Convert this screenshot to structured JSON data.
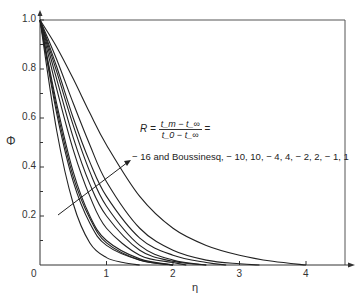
{
  "chart_data": {
    "type": "line",
    "title": "",
    "xlabel": "η",
    "ylabel": "Φ",
    "xlim": [
      0,
      4.6
    ],
    "ylim": [
      0,
      1.0
    ],
    "x_ticks": [
      "0",
      "1",
      "2",
      "3",
      "4"
    ],
    "y_ticks": [
      "0.2",
      "0.4",
      "0.6",
      "0.8",
      "1.0"
    ],
    "grid": false,
    "legend": null,
    "annotation": {
      "R_label": "R =",
      "numerator": "t_m − t_∞",
      "denominator": "t_0 − t_∞",
      "equals": "=",
      "values_text": "− 16 and Boussinesq, − 10, 10, − 4, 4, − 2, 2, − 1, 1",
      "arrow": "points in direction of increasing curve spread"
    },
    "series": [
      {
        "name": "-16",
        "x": [
          0,
          0.25,
          0.5,
          0.75,
          1.0,
          1.25,
          1.5
        ],
        "values": [
          1.0,
          0.55,
          0.25,
          0.09,
          0.03,
          0.01,
          0.0
        ]
      },
      {
        "name": "Boussinesq",
        "x": [
          0,
          0.25,
          0.5,
          0.75,
          1.0,
          1.5,
          2.0
        ],
        "values": [
          1.0,
          0.62,
          0.34,
          0.17,
          0.08,
          0.02,
          0.0
        ]
      },
      {
        "name": "-10",
        "x": [
          0,
          0.25,
          0.5,
          0.75,
          1.0,
          1.5,
          2.0
        ],
        "values": [
          1.0,
          0.64,
          0.36,
          0.19,
          0.09,
          0.02,
          0.0
        ]
      },
      {
        "name": "10",
        "x": [
          0,
          0.25,
          0.5,
          0.75,
          1.0,
          1.5,
          2.0
        ],
        "values": [
          1.0,
          0.66,
          0.38,
          0.2,
          0.1,
          0.025,
          0.0
        ]
      },
      {
        "name": "-4",
        "x": [
          0,
          0.25,
          0.5,
          0.75,
          1.0,
          1.5,
          2.0,
          2.2
        ],
        "values": [
          1.0,
          0.72,
          0.47,
          0.28,
          0.15,
          0.04,
          0.01,
          0.0
        ]
      },
      {
        "name": "4",
        "x": [
          0,
          0.25,
          0.5,
          0.75,
          1.0,
          1.5,
          2.0,
          2.5
        ],
        "values": [
          1.0,
          0.76,
          0.52,
          0.33,
          0.2,
          0.06,
          0.015,
          0.0
        ]
      },
      {
        "name": "-2",
        "x": [
          0,
          0.25,
          0.5,
          0.75,
          1.0,
          1.5,
          2.0,
          2.5
        ],
        "values": [
          1.0,
          0.79,
          0.57,
          0.38,
          0.24,
          0.08,
          0.02,
          0.0
        ]
      },
      {
        "name": "2",
        "x": [
          0,
          0.25,
          0.5,
          0.75,
          1.0,
          1.5,
          2.0,
          2.5,
          2.8
        ],
        "values": [
          1.0,
          0.81,
          0.6,
          0.42,
          0.28,
          0.11,
          0.04,
          0.01,
          0.0
        ]
      },
      {
        "name": "-1",
        "x": [
          0,
          0.25,
          0.5,
          0.75,
          1.0,
          1.5,
          2.0,
          2.5,
          3.0,
          3.3
        ],
        "values": [
          1.0,
          0.84,
          0.66,
          0.49,
          0.34,
          0.15,
          0.06,
          0.02,
          0.005,
          0.0
        ]
      },
      {
        "name": "1",
        "x": [
          0,
          0.25,
          0.5,
          0.75,
          1.0,
          1.5,
          2.0,
          2.5,
          3.0,
          3.5,
          4.0
        ],
        "values": [
          1.0,
          0.89,
          0.76,
          0.62,
          0.49,
          0.28,
          0.15,
          0.08,
          0.04,
          0.015,
          0.0
        ]
      }
    ]
  },
  "axes": {
    "origin_label": "0",
    "x_axis_label": "η",
    "y_axis_label": "Φ"
  }
}
